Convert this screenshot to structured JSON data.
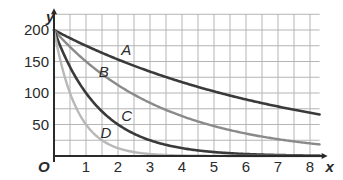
{
  "chart_data": {
    "type": "line",
    "title": "",
    "xlabel": "x",
    "ylabel": "y",
    "origin_label": "O",
    "xlim": [
      0,
      8.3
    ],
    "ylim": [
      0,
      225
    ],
    "x_ticks": [
      1,
      2,
      3,
      4,
      5,
      6,
      7,
      8
    ],
    "y_ticks": [
      50,
      100,
      150,
      200
    ],
    "grid": true,
    "grid_minor_x": 0.5,
    "grid_minor_y": 25,
    "legend": "inline labels",
    "series": [
      {
        "name": "A",
        "formula": "200*0.875^x",
        "color": "#3a3a3a",
        "x": [
          0,
          1,
          2,
          3,
          4,
          5,
          6,
          7,
          8
        ],
        "values": [
          200,
          175,
          153,
          134,
          117,
          103,
          90,
          79,
          69
        ],
        "label_pos": [
          2.1,
          160
        ]
      },
      {
        "name": "B",
        "formula": "200*0.75^x",
        "color": "#8a8a8a",
        "x": [
          0,
          1,
          2,
          3,
          4,
          5,
          6,
          7,
          8
        ],
        "values": [
          200,
          150,
          113,
          84,
          63,
          47,
          36,
          27,
          20
        ],
        "label_pos": [
          1.4,
          126
        ]
      },
      {
        "name": "C",
        "formula": "200*0.5^x",
        "color": "#3a3a3a",
        "x": [
          0,
          1,
          2,
          3,
          4,
          5,
          6,
          7,
          8
        ],
        "values": [
          200,
          100,
          50,
          25,
          12.5,
          6.3,
          3.1,
          1.6,
          0.8
        ],
        "label_pos": [
          2.1,
          56
        ]
      },
      {
        "name": "D",
        "formula": "200*0.25^x",
        "color": "#b8b8b8",
        "x": [
          0,
          1,
          2,
          3,
          4,
          5,
          6,
          7,
          8
        ],
        "values": [
          200,
          50,
          12.5,
          3.1,
          0.8,
          0.2,
          0,
          0,
          0
        ],
        "label_pos": [
          1.45,
          28
        ]
      }
    ]
  }
}
